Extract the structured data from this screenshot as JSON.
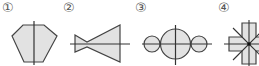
{
  "figures": [
    {
      "label": "①",
      "shape": "pentagon-with-vertical-axis"
    },
    {
      "label": "②",
      "shape": "bowtie-triangles-with-horizontal-axis"
    },
    {
      "label": "③",
      "shape": "three-circles-with-cross-axes"
    },
    {
      "label": "④",
      "shape": "cross-with-diagonal-axes"
    }
  ],
  "colors": {
    "fill": "#e2e2e2",
    "stroke": "#444444",
    "axis": "#333333",
    "label": "#555555"
  }
}
